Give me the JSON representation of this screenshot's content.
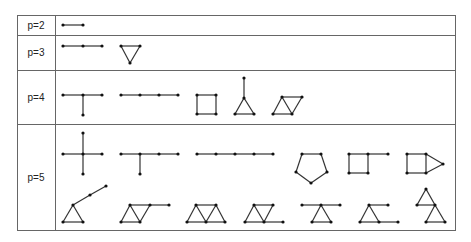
{
  "figure": {
    "colors": {
      "line": "#333333",
      "vertex": "#111111",
      "border": "#666666",
      "text": "#222222"
    },
    "rows": [
      {
        "label": "p=2",
        "graphs": [
          {
            "nodes": [
              [
                63,
                25
              ],
              [
                83,
                25
              ]
            ],
            "edges": [
              [
                0,
                1
              ]
            ]
          }
        ]
      },
      {
        "label": "p=3",
        "graphs": [
          {
            "nodes": [
              [
                63,
                46
              ],
              [
                83,
                46
              ],
              [
                102,
                46
              ]
            ],
            "edges": [
              [
                0,
                1
              ],
              [
                1,
                2
              ]
            ]
          },
          {
            "nodes": [
              [
                121,
                46
              ],
              [
                140,
                46
              ],
              [
                130,
                63
              ]
            ],
            "edges": [
              [
                0,
                1
              ],
              [
                1,
                2
              ],
              [
                2,
                0
              ]
            ]
          }
        ]
      },
      {
        "label": "p=4",
        "graphs": [
          {
            "nodes": [
              [
                63,
                95
              ],
              [
                83,
                95
              ],
              [
                102,
                95
              ],
              [
                83,
                115
              ]
            ],
            "edges": [
              [
                0,
                1
              ],
              [
                1,
                2
              ],
              [
                1,
                3
              ]
            ]
          },
          {
            "nodes": [
              [
                121,
                95
              ],
              [
                140,
                95
              ],
              [
                159,
                95
              ],
              [
                178,
                95
              ]
            ],
            "edges": [
              [
                0,
                1
              ],
              [
                1,
                2
              ],
              [
                2,
                3
              ]
            ]
          },
          {
            "nodes": [
              [
                197,
                95
              ],
              [
                216,
                95
              ],
              [
                216,
                114
              ],
              [
                197,
                114
              ]
            ],
            "edges": [
              [
                0,
                1
              ],
              [
                1,
                2
              ],
              [
                2,
                3
              ],
              [
                3,
                0
              ]
            ]
          },
          {
            "nodes": [
              [
                244,
                78
              ],
              [
                244,
                98
              ],
              [
                235,
                114
              ],
              [
                254,
                114
              ]
            ],
            "edges": [
              [
                0,
                1
              ],
              [
                1,
                2
              ],
              [
                1,
                3
              ],
              [
                2,
                3
              ]
            ]
          },
          {
            "nodes": [
              [
                273,
                114
              ],
              [
                282,
                97
              ],
              [
                292,
                114
              ],
              [
                302,
                97
              ]
            ],
            "edges": [
              [
                0,
                1
              ],
              [
                1,
                2
              ],
              [
                0,
                2
              ],
              [
                2,
                3
              ],
              [
                1,
                3
              ]
            ]
          }
        ]
      },
      {
        "label": "p=5",
        "graphs": [
          {
            "nodes": [
              [
                83,
                154
              ],
              [
                63,
                154
              ],
              [
                102,
                154
              ],
              [
                83,
                133
              ],
              [
                83,
                174
              ]
            ],
            "edges": [
              [
                0,
                1
              ],
              [
                0,
                2
              ],
              [
                0,
                3
              ],
              [
                0,
                4
              ]
            ]
          },
          {
            "nodes": [
              [
                121,
                154
              ],
              [
                140,
                154
              ],
              [
                159,
                154
              ],
              [
                178,
                154
              ],
              [
                140,
                174
              ]
            ],
            "edges": [
              [
                0,
                1
              ],
              [
                1,
                2
              ],
              [
                2,
                3
              ],
              [
                1,
                4
              ]
            ]
          },
          {
            "nodes": [
              [
                197,
                154
              ],
              [
                216,
                154
              ],
              [
                235,
                154
              ],
              [
                254,
                154
              ],
              [
                273,
                154
              ]
            ],
            "edges": [
              [
                0,
                1
              ],
              [
                1,
                2
              ],
              [
                2,
                3
              ],
              [
                3,
                4
              ]
            ]
          },
          {
            "nodes": [
              [
                302,
                154
              ],
              [
                321,
                154
              ],
              [
                327,
                172
              ],
              [
                311,
                183
              ],
              [
                296,
                172
              ]
            ],
            "edges": [
              [
                0,
                1
              ],
              [
                1,
                2
              ],
              [
                2,
                3
              ],
              [
                3,
                4
              ],
              [
                4,
                0
              ]
            ]
          },
          {
            "nodes": [
              [
                349,
                154
              ],
              [
                368,
                154
              ],
              [
                368,
                173
              ],
              [
                349,
                173
              ],
              [
                388,
                154
              ]
            ],
            "edges": [
              [
                0,
                1
              ],
              [
                1,
                2
              ],
              [
                2,
                3
              ],
              [
                3,
                0
              ],
              [
                1,
                4
              ]
            ]
          },
          {
            "nodes": [
              [
                407,
                154
              ],
              [
                426,
                154
              ],
              [
                426,
                173
              ],
              [
                407,
                173
              ],
              [
                443,
                164
              ]
            ],
            "edges": [
              [
                0,
                1
              ],
              [
                1,
                2
              ],
              [
                2,
                3
              ],
              [
                3,
                0
              ],
              [
                1,
                4
              ],
              [
                2,
                4
              ]
            ]
          },
          {
            "nodes": [
              [
                63,
                222
              ],
              [
                83,
                222
              ],
              [
                73,
                205
              ],
              [
                90,
                195
              ],
              [
                106,
                186
              ]
            ],
            "edges": [
              [
                0,
                1
              ],
              [
                1,
                2
              ],
              [
                2,
                0
              ],
              [
                2,
                3
              ],
              [
                3,
                4
              ]
            ]
          },
          {
            "nodes": [
              [
                121,
                222
              ],
              [
                130,
                205
              ],
              [
                140,
                222
              ],
              [
                150,
                205
              ],
              [
                169,
                205
              ]
            ],
            "edges": [
              [
                0,
                1
              ],
              [
                1,
                2
              ],
              [
                0,
                2
              ],
              [
                2,
                3
              ],
              [
                1,
                3
              ],
              [
                3,
                4
              ]
            ]
          },
          {
            "nodes": [
              [
                187,
                222
              ],
              [
                196,
                205
              ],
              [
                206,
                222
              ],
              [
                216,
                205
              ],
              [
                225,
                222
              ]
            ],
            "edges": [
              [
                0,
                1
              ],
              [
                1,
                2
              ],
              [
                0,
                2
              ],
              [
                2,
                3
              ],
              [
                1,
                3
              ],
              [
                3,
                4
              ],
              [
                2,
                4
              ]
            ]
          },
          {
            "nodes": [
              [
                245,
                222
              ],
              [
                254,
                205
              ],
              [
                264,
                222
              ],
              [
                273,
                205
              ],
              [
                283,
                222
              ]
            ],
            "edges": [
              [
                0,
                1
              ],
              [
                1,
                2
              ],
              [
                0,
                2
              ],
              [
                2,
                3
              ],
              [
                1,
                3
              ],
              [
                2,
                4
              ]
            ]
          },
          {
            "nodes": [
              [
                302,
                205
              ],
              [
                321,
                205
              ],
              [
                340,
                205
              ],
              [
                312,
                222
              ],
              [
                331,
                222
              ]
            ],
            "edges": [
              [
                0,
                1
              ],
              [
                1,
                2
              ],
              [
                1,
                3
              ],
              [
                1,
                4
              ],
              [
                3,
                4
              ]
            ]
          },
          {
            "nodes": [
              [
                360,
                222
              ],
              [
                379,
                222
              ],
              [
                369,
                205
              ],
              [
                388,
                205
              ],
              [
                398,
                222
              ]
            ],
            "edges": [
              [
                0,
                1
              ],
              [
                1,
                2
              ],
              [
                2,
                0
              ],
              [
                2,
                3
              ],
              [
                1,
                4
              ]
            ]
          },
          {
            "nodes": [
              [
                426,
                189
              ],
              [
                417,
                205
              ],
              [
                435,
                205
              ],
              [
                426,
                222
              ],
              [
                445,
                222
              ]
            ],
            "edges": [
              [
                0,
                1
              ],
              [
                0,
                2
              ],
              [
                1,
                2
              ],
              [
                2,
                3
              ],
              [
                2,
                4
              ],
              [
                3,
                4
              ]
            ]
          }
        ]
      }
    ]
  }
}
